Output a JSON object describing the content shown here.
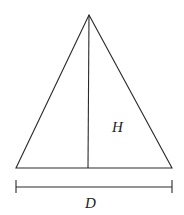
{
  "diagram": {
    "labels": {
      "height": "H",
      "diameter": "D"
    },
    "colors": {
      "stroke": "#2a2a2a",
      "background": "#ffffff"
    }
  }
}
